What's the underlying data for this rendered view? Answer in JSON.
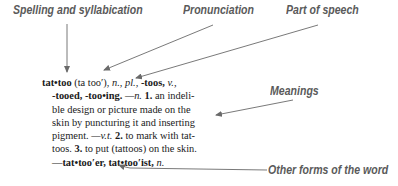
{
  "labels": {
    "spelling": "Spelling and syllabication",
    "pronunciation": "Pronunciation",
    "part_of_speech": "Part of speech",
    "meanings": "Meanings",
    "other_forms": "Other forms of the word"
  },
  "entry": {
    "headword": "tat•too",
    "pronunciation": "(ta too′),",
    "pos_n": "n.,",
    "pl": "pl.,",
    "plural_form": "-toos,",
    "pos_v": "v.,",
    "verb_forms": "-tooed, -too•ing.",
    "dash_n": "—n.",
    "num1": "1.",
    "def1_a": "an indeli-",
    "def1_b": "ble design or picture made on the",
    "def1_c": "skin by puncturing it and inserting",
    "def1_d": "pigment.",
    "dash_vt": "—v.t.",
    "num2": "2.",
    "def2_a": "to mark with tat-",
    "def2_b": "toos.",
    "num3": "3.",
    "def3": "to put (tattoos) on the skin.",
    "other_forms": "—tat•too′er, tat•too′ist,",
    "other_pos": "n."
  },
  "colors": {
    "label_text": "#5a5a5a",
    "arrow": "#6a6a6a",
    "entry_text": "#1a1a1a",
    "background": "#ffffff"
  }
}
